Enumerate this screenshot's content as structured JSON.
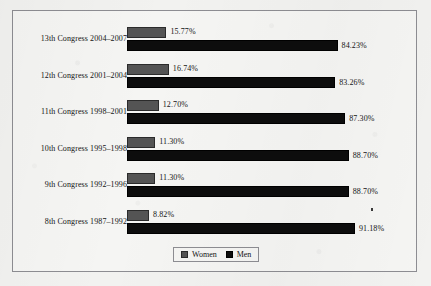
{
  "chart_data": {
    "type": "bar",
    "orientation": "horizontal",
    "title": "",
    "xlabel": "",
    "ylabel": "",
    "xlim": [
      0,
      100
    ],
    "grid": false,
    "legend_position": "bottom-center",
    "value_suffix": "%",
    "categories": [
      "13th Congress 2004–2007",
      "12th Congress 2001–2004",
      "11th Congress 1998–2001",
      "10th Congress 1995–1998",
      "9th Congress 1992–1996",
      "8th Congress 1987–1992"
    ],
    "series": [
      {
        "name": "Women",
        "color": "#545454",
        "values": [
          15.77,
          16.74,
          12.7,
          11.3,
          11.3,
          8.82
        ],
        "labels": [
          "15.77%",
          "16.74%",
          "12.70%",
          "11.30%",
          "11.30%",
          "8.82%"
        ]
      },
      {
        "name": "Men",
        "color": "#0d0d0d",
        "values": [
          84.23,
          83.26,
          87.3,
          88.7,
          88.7,
          91.18
        ],
        "labels": [
          "84.23%",
          "83.26%",
          "87.30%",
          "88.70%",
          "88.70%",
          "91.18%"
        ]
      }
    ]
  },
  "legend": {
    "items": [
      {
        "label": "Women",
        "color": "#545454"
      },
      {
        "label": "Men",
        "color": "#0d0d0d"
      }
    ]
  }
}
